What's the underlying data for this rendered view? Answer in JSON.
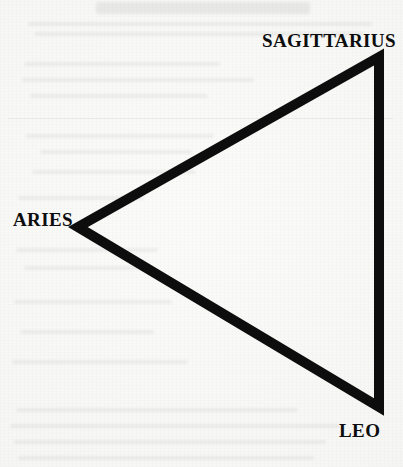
{
  "figure": {
    "type": "diagram",
    "shape": "triangle",
    "background_color": "#f6f6f4",
    "stroke_color": "#0d0d0d",
    "stroke_width_px": 10,
    "vertices": [
      {
        "id": "sagittarius",
        "label": "SAGITTARIUS",
        "x": 379,
        "y": 57,
        "label_x": 262,
        "label_y": 31
      },
      {
        "id": "aries",
        "label": "ARIES",
        "x": 78,
        "y": 227,
        "label_x": 13,
        "label_y": 210
      },
      {
        "id": "leo",
        "label": "LEO",
        "x": 379,
        "y": 407,
        "label_x": 339,
        "label_y": 421
      }
    ]
  },
  "chart_data": {
    "type": "diagram",
    "title": "",
    "categories": [
      "SAGITTARIUS",
      "ARIES",
      "LEO"
    ],
    "points": [
      {
        "name": "SAGITTARIUS",
        "x": 379,
        "y": 57
      },
      {
        "name": "ARIES",
        "x": 78,
        "y": 227
      },
      {
        "name": "LEO",
        "x": 379,
        "y": 407
      }
    ],
    "edges": [
      [
        "ARIES",
        "SAGITTARIUS"
      ],
      [
        "SAGITTARIUS",
        "LEO"
      ],
      [
        "LEO",
        "ARIES"
      ]
    ],
    "xlabel": "",
    "ylabel": "",
    "grid": false,
    "legend": false
  },
  "page": {
    "width": 403,
    "height": 467
  },
  "ghost_text": {
    "note": "faint show-through from the reverse side of the scanned page; illegible"
  }
}
